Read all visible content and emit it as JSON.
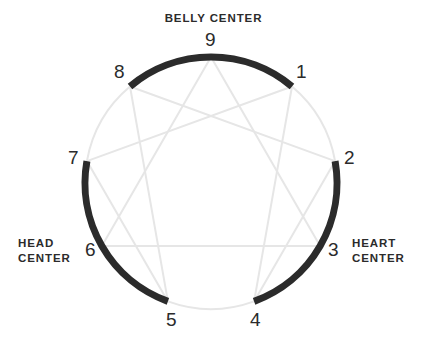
{
  "diagram": {
    "type": "enneagram",
    "background_color": "#ffffff",
    "geometry": {
      "center_x": 211,
      "center_y": 183,
      "radius": 126,
      "point_count": 9,
      "point_1_angle_deg": -50,
      "angle_step_deg": 40
    },
    "colors": {
      "dark_arc": "#2b2b2b",
      "light_arc": "#e6e6e6",
      "inner_line": "#e6e6e6",
      "text": "#2b2b2b"
    },
    "stroke_widths": {
      "dark_arc": 7,
      "light_arc": 2,
      "inner_line": 2
    }
  },
  "points": [
    {
      "number": "1",
      "label_x": 296,
      "label_y": 62
    },
    {
      "number": "2",
      "label_x": 344,
      "label_y": 148
    },
    {
      "number": "3",
      "label_x": 328,
      "label_y": 240
    },
    {
      "number": "4",
      "label_x": 250,
      "label_y": 310
    },
    {
      "number": "5",
      "label_x": 166,
      "label_y": 310
    },
    {
      "number": "6",
      "label_x": 85,
      "label_y": 240
    },
    {
      "number": "7",
      "label_x": 68,
      "label_y": 148
    },
    {
      "number": "8",
      "label_x": 114,
      "label_y": 62
    },
    {
      "number": "9",
      "label_x": 205,
      "label_y": 30
    }
  ],
  "centers": [
    {
      "name": "belly-center",
      "label": "BELLY CENTER",
      "line1": "BELLY",
      "line2": "CENTER",
      "single_line": true,
      "arc_from_point": 8,
      "arc_to_point": 1,
      "arc_color": "#2b2b2b",
      "types": [
        "8",
        "9",
        "1"
      ]
    },
    {
      "name": "heart-center",
      "label": "HEART CENTER",
      "line1": "HEART",
      "line2": "CENTER",
      "single_line": false,
      "arc_from_point": 2,
      "arc_to_point": 4,
      "arc_color": "#2b2b2b",
      "types": [
        "2",
        "3",
        "4"
      ]
    },
    {
      "name": "head-center",
      "label": "HEAD CENTER",
      "line1": "HEAD",
      "line2": "CENTER",
      "single_line": false,
      "arc_from_point": 5,
      "arc_to_point": 7,
      "arc_color": "#2b2b2b",
      "types": [
        "5",
        "6",
        "7"
      ]
    }
  ],
  "light_arcs": [
    {
      "name": "arc-1-to-2",
      "from_point": 1,
      "to_point": 2
    },
    {
      "name": "arc-4-to-5",
      "from_point": 4,
      "to_point": 5
    },
    {
      "name": "arc-7-to-8",
      "from_point": 7,
      "to_point": 8
    }
  ],
  "inner_lines": {
    "triangle": {
      "name": "inner-triangle",
      "sequence": [
        "9",
        "3",
        "6",
        "9"
      ],
      "color": "#e6e6e6"
    },
    "hexad": {
      "name": "inner-hexad",
      "sequence": [
        "1",
        "4",
        "2",
        "8",
        "5",
        "7",
        "1"
      ],
      "color": "#e6e6e6"
    }
  },
  "chart_data": {
    "type": "diagram",
    "categories": [
      "1",
      "2",
      "3",
      "4",
      "5",
      "6",
      "7",
      "8",
      "9"
    ],
    "groups": [
      {
        "name": "BELLY CENTER",
        "members": [
          "8",
          "9",
          "1"
        ]
      },
      {
        "name": "HEART CENTER",
        "members": [
          "2",
          "3",
          "4"
        ]
      },
      {
        "name": "HEAD CENTER",
        "members": [
          "5",
          "6",
          "7"
        ]
      }
    ]
  }
}
